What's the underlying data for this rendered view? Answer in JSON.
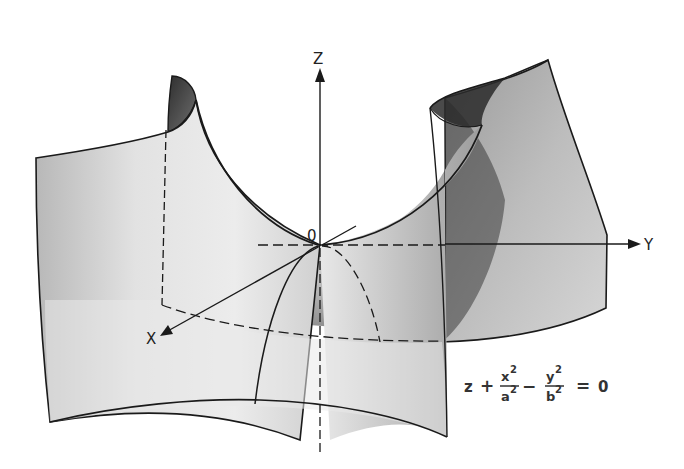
{
  "diagram": {
    "axes": {
      "z_label": "Z",
      "y_label": "Y",
      "x_label": "X",
      "origin_label": "0"
    },
    "equation": {
      "lhs_var": "z",
      "plus": "+",
      "frac1_num": "x",
      "frac1_num_exp": "2",
      "frac1_den": "a",
      "frac1_den_exp": "2",
      "minus": "−",
      "frac2_num": "y",
      "frac2_num_exp": "2",
      "frac2_den": "b",
      "frac2_den_exp": "2",
      "equals": "=",
      "rhs": "0"
    },
    "colors": {
      "outline": "#1a1a1a",
      "surface_light": "#f0f0f0",
      "surface_mid": "#c8c8c8",
      "surface_dark": "#4a4a4a",
      "background": "#ffffff"
    }
  }
}
